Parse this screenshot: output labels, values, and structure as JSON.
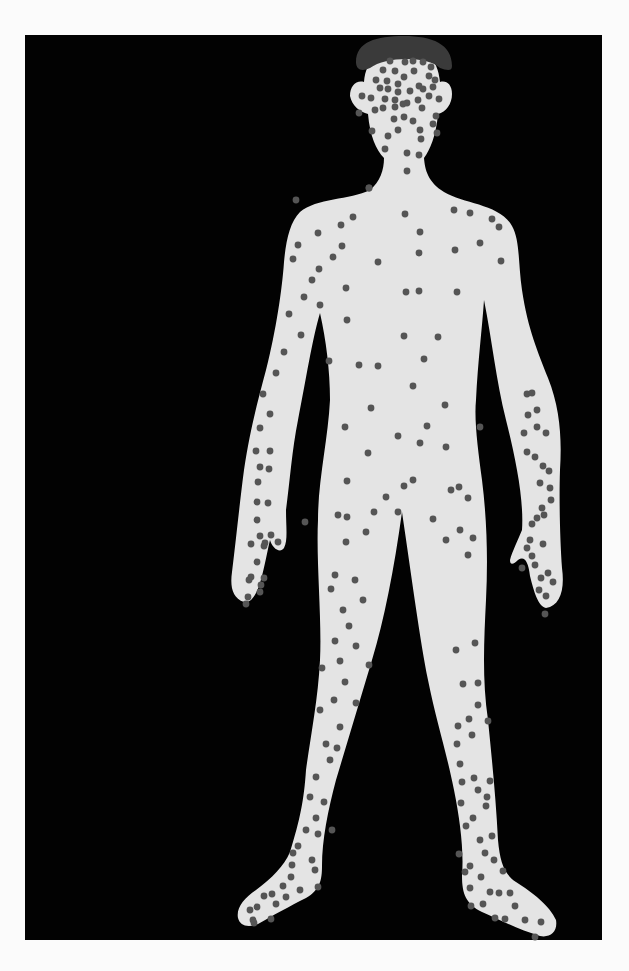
{
  "figure": {
    "colors": {
      "page_background": "#fbfbfb",
      "panel_background": "#020202",
      "body_fill": "#e4e4e4",
      "hair_fill": "#3a3a3a",
      "spot_fill": "#555555"
    },
    "spot_radius": 3.4,
    "spots": {
      "head": [
        [
          390,
          61
        ],
        [
          405,
          62
        ],
        [
          413,
          61
        ],
        [
          423,
          62
        ],
        [
          431,
          67
        ],
        [
          383,
          70
        ],
        [
          395,
          71
        ],
        [
          414,
          71
        ],
        [
          429,
          76
        ],
        [
          435,
          80
        ],
        [
          376,
          80
        ],
        [
          387,
          81
        ],
        [
          404,
          77
        ],
        [
          398,
          84
        ],
        [
          419,
          86
        ],
        [
          380,
          88
        ],
        [
          388,
          89
        ],
        [
          398,
          92
        ],
        [
          410,
          91
        ],
        [
          423,
          89
        ],
        [
          433,
          87
        ],
        [
          362,
          96
        ],
        [
          371,
          98
        ],
        [
          385,
          99
        ],
        [
          395,
          100
        ],
        [
          407,
          103
        ],
        [
          418,
          100
        ],
        [
          429,
          96
        ],
        [
          439,
          99
        ],
        [
          359,
          113
        ],
        [
          375,
          110
        ],
        [
          383,
          108
        ],
        [
          395,
          107
        ],
        [
          403,
          104
        ],
        [
          422,
          108
        ],
        [
          436,
          116
        ],
        [
          394,
          119
        ],
        [
          404,
          117
        ],
        [
          413,
          121
        ],
        [
          433,
          124
        ],
        [
          398,
          130
        ],
        [
          372,
          131
        ],
        [
          420,
          130
        ],
        [
          388,
          136
        ],
        [
          421,
          139
        ],
        [
          437,
          133
        ],
        [
          385,
          149
        ],
        [
          407,
          153
        ],
        [
          419,
          155
        ],
        [
          407,
          171
        ],
        [
          369,
          188
        ]
      ],
      "torso": [
        [
          369,
          188
        ],
        [
          405,
          214
        ],
        [
          454,
          210
        ],
        [
          470,
          213
        ],
        [
          492,
          219
        ],
        [
          353,
          217
        ],
        [
          341,
          225
        ],
        [
          318,
          233
        ],
        [
          342,
          246
        ],
        [
          420,
          232
        ],
        [
          499,
          227
        ],
        [
          298,
          245
        ],
        [
          333,
          257
        ],
        [
          480,
          243
        ],
        [
          455,
          250
        ],
        [
          419,
          253
        ],
        [
          501,
          261
        ],
        [
          378,
          262
        ],
        [
          319,
          269
        ],
        [
          312,
          280
        ],
        [
          346,
          288
        ],
        [
          304,
          297
        ],
        [
          419,
          291
        ],
        [
          457,
          292
        ],
        [
          320,
          305
        ],
        [
          406,
          292
        ],
        [
          347,
          320
        ],
        [
          359,
          365
        ],
        [
          329,
          361
        ],
        [
          404,
          336
        ],
        [
          438,
          337
        ],
        [
          301,
          335
        ],
        [
          424,
          359
        ],
        [
          413,
          386
        ],
        [
          378,
          366
        ],
        [
          371,
          408
        ],
        [
          445,
          405
        ],
        [
          427,
          426
        ],
        [
          398,
          436
        ],
        [
          345,
          427
        ],
        [
          480,
          427
        ],
        [
          368,
          453
        ],
        [
          446,
          447
        ],
        [
          420,
          443
        ],
        [
          347,
          481
        ],
        [
          404,
          486
        ],
        [
          451,
          490
        ],
        [
          374,
          512
        ],
        [
          347,
          517
        ],
        [
          305,
          522
        ],
        [
          338,
          515
        ]
      ],
      "left_arm": [
        [
          296,
          200
        ],
        [
          293,
          259
        ],
        [
          289,
          314
        ],
        [
          284,
          352
        ],
        [
          276,
          373
        ],
        [
          263,
          394
        ],
        [
          270,
          414
        ],
        [
          260,
          428
        ],
        [
          256,
          451
        ],
        [
          270,
          451
        ],
        [
          260,
          467
        ],
        [
          258,
          482
        ],
        [
          269,
          469
        ],
        [
          257,
          502
        ],
        [
          268,
          503
        ],
        [
          257,
          520
        ],
        [
          260,
          536
        ],
        [
          265,
          543
        ],
        [
          251,
          544
        ],
        [
          271,
          535
        ],
        [
          257,
          562
        ],
        [
          251,
          577
        ],
        [
          264,
          578
        ],
        [
          248,
          597
        ],
        [
          261,
          585
        ],
        [
          246,
          604
        ],
        [
          278,
          542
        ],
        [
          264,
          546
        ],
        [
          249,
          580
        ],
        [
          260,
          592
        ]
      ],
      "right_arm": [
        [
          527,
          394
        ],
        [
          532,
          393
        ],
        [
          528,
          415
        ],
        [
          537,
          410
        ],
        [
          537,
          427
        ],
        [
          546,
          433
        ],
        [
          524,
          433
        ],
        [
          527,
          452
        ],
        [
          535,
          457
        ],
        [
          543,
          466
        ],
        [
          549,
          471
        ],
        [
          540,
          483
        ],
        [
          550,
          488
        ],
        [
          542,
          508
        ],
        [
          551,
          500
        ],
        [
          537,
          518
        ],
        [
          530,
          540
        ],
        [
          543,
          544
        ],
        [
          532,
          556
        ],
        [
          535,
          565
        ],
        [
          541,
          578
        ],
        [
          548,
          573
        ],
        [
          553,
          582
        ],
        [
          546,
          596
        ],
        [
          545,
          614
        ],
        [
          527,
          548
        ],
        [
          544,
          515
        ],
        [
          522,
          568
        ],
        [
          532,
          524
        ],
        [
          539,
          590
        ]
      ],
      "legs": [
        [
          346,
          542
        ],
        [
          366,
          532
        ],
        [
          386,
          497
        ],
        [
          398,
          512
        ],
        [
          413,
          480
        ],
        [
          433,
          519
        ],
        [
          459,
          487
        ],
        [
          468,
          498
        ],
        [
          460,
          530
        ],
        [
          473,
          538
        ],
        [
          468,
          555
        ],
        [
          446,
          540
        ],
        [
          335,
          575
        ],
        [
          355,
          580
        ],
        [
          331,
          589
        ],
        [
          363,
          600
        ],
        [
          343,
          610
        ],
        [
          349,
          626
        ],
        [
          335,
          641
        ],
        [
          356,
          646
        ],
        [
          322,
          668
        ],
        [
          340,
          661
        ],
        [
          345,
          682
        ],
        [
          334,
          700
        ],
        [
          320,
          710
        ],
        [
          356,
          703
        ],
        [
          369,
          665
        ],
        [
          340,
          727
        ],
        [
          326,
          744
        ],
        [
          337,
          748
        ],
        [
          330,
          760
        ],
        [
          316,
          777
        ],
        [
          310,
          797
        ],
        [
          324,
          802
        ],
        [
          316,
          818
        ],
        [
          306,
          830
        ],
        [
          332,
          830
        ],
        [
          318,
          834
        ],
        [
          298,
          846
        ],
        [
          293,
          853
        ],
        [
          315,
          870
        ],
        [
          312,
          860
        ],
        [
          291,
          877
        ],
        [
          300,
          890
        ],
        [
          283,
          886
        ],
        [
          264,
          896
        ],
        [
          272,
          894
        ],
        [
          276,
          904
        ],
        [
          257,
          907
        ],
        [
          253,
          920
        ],
        [
          250,
          910
        ],
        [
          271,
          919
        ],
        [
          254,
          923
        ],
        [
          292,
          865
        ],
        [
          318,
          887
        ],
        [
          286,
          897
        ],
        [
          456,
          650
        ],
        [
          475,
          643
        ],
        [
          463,
          684
        ],
        [
          478,
          683
        ],
        [
          478,
          705
        ],
        [
          469,
          719
        ],
        [
          488,
          721
        ],
        [
          458,
          726
        ],
        [
          472,
          735
        ],
        [
          457,
          744
        ],
        [
          460,
          764
        ],
        [
          474,
          778
        ],
        [
          490,
          781
        ],
        [
          462,
          782
        ],
        [
          478,
          790
        ],
        [
          487,
          797
        ],
        [
          461,
          803
        ],
        [
          466,
          826
        ],
        [
          473,
          818
        ],
        [
          486,
          806
        ],
        [
          480,
          840
        ],
        [
          494,
          860
        ],
        [
          503,
          871
        ],
        [
          459,
          854
        ],
        [
          465,
          872
        ],
        [
          481,
          877
        ],
        [
          490,
          892
        ],
        [
          510,
          893
        ],
        [
          499,
          893
        ],
        [
          515,
          906
        ],
        [
          505,
          919
        ],
        [
          525,
          920
        ],
        [
          541,
          922
        ],
        [
          535,
          937
        ],
        [
          495,
          918
        ],
        [
          483,
          904
        ],
        [
          471,
          906
        ],
        [
          470,
          888
        ],
        [
          470,
          866
        ],
        [
          485,
          853
        ],
        [
          492,
          836
        ]
      ]
    },
    "shapes": {
      "panel": {
        "x": 25,
        "y": 35,
        "width": 577,
        "height": 905
      },
      "hair": "M356,62 C356,42 376,36 404,36 C432,36 452,44 452,66 C452,72 446,70 440,68 C428,56 386,56 370,68 C362,72 356,70 356,62 Z",
      "body": "M404,46 C424,46 438,58 440,82 C446,80 452,84 452,94 C452,104 446,112 438,114 C436,136 430,150 424,158 C425,170 428,182 444,192 C464,204 500,204 512,226 C520,240 518,262 522,290 C528,330 538,352 548,378 C560,408 562,438 560,470 C559,500 560,540 562,568 C565,590 560,606 546,608 C538,606 534,592 530,576 C528,560 524,556 518,560 C514,564 510,566 510,560 C512,552 518,540 522,530 C524,500 516,460 506,420 C496,380 492,340 484,300 C482,330 478,360 476,400 C474,420 478,450 482,480 C487,520 488,560 486,600 C484,640 482,680 488,720 C492,760 496,800 498,840 C500,862 504,874 516,882 C532,892 550,906 556,920 C558,932 550,938 540,936 C520,930 500,920 482,912 C466,904 462,894 462,876 C464,850 460,820 454,790 C446,750 436,720 428,680 C420,640 412,580 402,512 C394,570 384,620 372,660 C360,700 348,740 336,780 C328,810 322,840 322,866 C322,880 320,890 306,898 C290,906 272,916 258,924 C248,928 240,926 238,918 C236,908 244,898 256,890 C272,878 284,866 290,852 C300,820 304,800 306,770 C310,740 318,700 320,660 C322,620 316,560 318,520 C318,480 328,440 330,400 C330,370 326,340 320,313 C312,340 306,380 298,420 C292,450 290,480 286,510 C286,528 288,540 284,548 C280,554 272,548 270,540 C268,548 266,560 262,576 C258,592 252,604 244,602 C232,598 230,586 232,572 C236,540 240,500 244,470 C250,430 258,400 266,370 C276,330 282,290 284,262 C286,240 290,222 300,212 C316,198 350,200 370,190 C380,182 384,170 384,158 C376,150 370,136 368,114 C360,112 352,106 350,96 C350,86 356,80 364,82 C366,58 382,46 404,46 Z"
    }
  }
}
